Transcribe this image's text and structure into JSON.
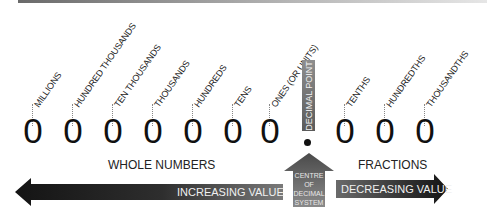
{
  "diagram": {
    "digit": "0",
    "places": [
      {
        "label": "MILLIONS",
        "x": 18
      },
      {
        "label": "HUNDRED THOUSANDS",
        "x": 58
      },
      {
        "label": "TEN THOUSANDS",
        "x": 98
      },
      {
        "label": "THOUSANDS",
        "x": 138
      },
      {
        "label": "HUNDREDS",
        "x": 178
      },
      {
        "label": "TENS",
        "x": 218
      },
      {
        "label": "ONES (OR UNITS)",
        "x": 255
      },
      {
        "label": "TENTHS",
        "x": 330
      },
      {
        "label": "HUNDREDTHS",
        "x": 370
      },
      {
        "label": "THOUSANDTHS",
        "x": 410
      }
    ],
    "decimal_point_label": "DECIMAL POINT",
    "whole_numbers_label": "WHOLE NUMBERS",
    "fractions_label": "FRACTIONS",
    "increasing_label": "INCREASING VALUE",
    "decreasing_label": "DECREASING VALUE",
    "centre_label_lines": [
      "CENTRE",
      "OF",
      "DECIMAL",
      "SYSTEM"
    ],
    "colors": {
      "arrow_dark": "#1e1e1e",
      "arrow_mid": "#5c5c5c",
      "arrow_light": "#8a8a8a",
      "text": "#222222"
    }
  }
}
